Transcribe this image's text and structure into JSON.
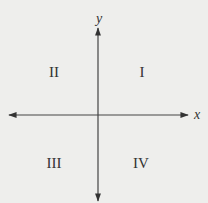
{
  "diagram": {
    "axes": {
      "x_label": "x",
      "y_label": "y"
    },
    "quadrants": [
      {
        "id": "I",
        "label": "I"
      },
      {
        "id": "II",
        "label": "II"
      },
      {
        "id": "III",
        "label": "III"
      },
      {
        "id": "IV",
        "label": "IV"
      }
    ],
    "colors": {
      "background": "#eeeeec",
      "ink": "#333333"
    }
  }
}
